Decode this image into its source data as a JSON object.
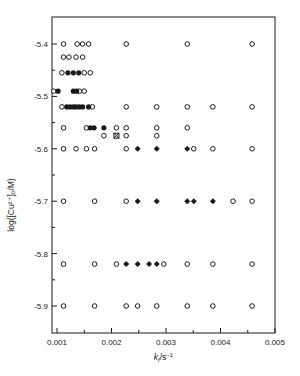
{
  "chart_data": {
    "type": "scatter",
    "title": "",
    "xlabel": "k_f/s^-1",
    "xlabel_parts": {
      "main": "k",
      "sub": "f",
      "rest": "/s",
      "sup": "−1"
    },
    "ylabel": "log([Cu2+]0/M)",
    "ylabel_text": "log([Cu²⁺]₀/M)",
    "xlim": [
      0.00092,
      0.005
    ],
    "ylim": [
      -5.95,
      -5.35
    ],
    "xticks": [
      0.001,
      0.002,
      0.003,
      0.004,
      0.005
    ],
    "xtick_labels": [
      "0.001",
      "0.002",
      "0.003",
      "0.004",
      "0.005"
    ],
    "xminor": [
      0.0015,
      0.0025,
      0.0035,
      0.0045
    ],
    "yticks": [
      -5.4,
      -5.5,
      -5.6,
      -5.7,
      -5.8,
      -5.9
    ],
    "ytick_labels": [
      "-5.4",
      "-5.5",
      "-5.6",
      "-5.7",
      "-5.8",
      "-5.9"
    ],
    "yminor": [
      -5.45,
      -5.55,
      -5.65,
      -5.75,
      -5.85
    ],
    "grid": false,
    "legend": null,
    "series": [
      {
        "name": "open circles",
        "marker": "open-circle",
        "points": [
          [
            0.00112,
            -5.4
          ],
          [
            0.00137,
            -5.4
          ],
          [
            0.00147,
            -5.4
          ],
          [
            0.00158,
            -5.4
          ],
          [
            0.00227,
            -5.4
          ],
          [
            0.00339,
            -5.4
          ],
          [
            0.00458,
            -5.4
          ],
          [
            0.00112,
            -5.425
          ],
          [
            0.00122,
            -5.425
          ],
          [
            0.00135,
            -5.425
          ],
          [
            0.00147,
            -5.425
          ],
          [
            0.00109,
            -5.455
          ],
          [
            0.0015,
            -5.455
          ],
          [
            0.00161,
            -5.455
          ],
          [
            0.00094,
            -5.49
          ],
          [
            0.00141,
            -5.49
          ],
          [
            0.0015,
            -5.49
          ],
          [
            0.00109,
            -5.52
          ],
          [
            0.00165,
            -5.52
          ],
          [
            0.00227,
            -5.52
          ],
          [
            0.00283,
            -5.52
          ],
          [
            0.00339,
            -5.52
          ],
          [
            0.00386,
            -5.52
          ],
          [
            0.00458,
            -5.52
          ],
          [
            0.00112,
            -5.56
          ],
          [
            0.00154,
            -5.56
          ],
          [
            0.00209,
            -5.56
          ],
          [
            0.00227,
            -5.56
          ],
          [
            0.00283,
            -5.56
          ],
          [
            0.00339,
            -5.56
          ],
          [
            0.00186,
            -5.575
          ],
          [
            0.00227,
            -5.575
          ],
          [
            0.00283,
            -5.575
          ],
          [
            0.00112,
            -5.6
          ],
          [
            0.00135,
            -5.6
          ],
          [
            0.00154,
            -5.6
          ],
          [
            0.00169,
            -5.6
          ],
          [
            0.00227,
            -5.6
          ],
          [
            0.00351,
            -5.6
          ],
          [
            0.00386,
            -5.6
          ],
          [
            0.00458,
            -5.6
          ],
          [
            0.00112,
            -5.7
          ],
          [
            0.00169,
            -5.7
          ],
          [
            0.00227,
            -5.7
          ],
          [
            0.00423,
            -5.7
          ],
          [
            0.00458,
            -5.7
          ],
          [
            0.00112,
            -5.82
          ],
          [
            0.00169,
            -5.82
          ],
          [
            0.00209,
            -5.82
          ],
          [
            0.00296,
            -5.82
          ],
          [
            0.00339,
            -5.82
          ],
          [
            0.00386,
            -5.82
          ],
          [
            0.00458,
            -5.82
          ],
          [
            0.00112,
            -5.9
          ],
          [
            0.00169,
            -5.9
          ],
          [
            0.00227,
            -5.9
          ],
          [
            0.00248,
            -5.9
          ],
          [
            0.00283,
            -5.9
          ],
          [
            0.00339,
            -5.9
          ],
          [
            0.00386,
            -5.9
          ],
          [
            0.00458,
            -5.9
          ]
        ]
      },
      {
        "name": "filled circles",
        "marker": "filled-circle",
        "points": [
          [
            0.0012,
            -5.455
          ],
          [
            0.0013,
            -5.455
          ],
          [
            0.0014,
            -5.455
          ],
          [
            0.00102,
            -5.49
          ],
          [
            0.0013,
            -5.49
          ],
          [
            0.00136,
            -5.49
          ],
          [
            0.00118,
            -5.52
          ],
          [
            0.00124,
            -5.52
          ],
          [
            0.0013,
            -5.52
          ],
          [
            0.00135,
            -5.52
          ],
          [
            0.00141,
            -5.52
          ],
          [
            0.00147,
            -5.52
          ],
          [
            0.00158,
            -5.52
          ],
          [
            0.00161,
            -5.56
          ],
          [
            0.00168,
            -5.56
          ],
          [
            0.00186,
            -5.56
          ]
        ]
      },
      {
        "name": "filled diamonds",
        "marker": "filled-diamond",
        "points": [
          [
            0.00248,
            -5.6
          ],
          [
            0.00283,
            -5.6
          ],
          [
            0.00339,
            -5.6
          ],
          [
            0.00248,
            -5.7
          ],
          [
            0.00283,
            -5.7
          ],
          [
            0.00339,
            -5.7
          ],
          [
            0.00351,
            -5.7
          ],
          [
            0.00386,
            -5.7
          ],
          [
            0.00227,
            -5.82
          ],
          [
            0.00248,
            -5.82
          ],
          [
            0.00269,
            -5.82
          ],
          [
            0.00283,
            -5.82
          ]
        ]
      },
      {
        "name": "crossed square",
        "marker": "crossed-square",
        "points": [
          [
            0.00209,
            -5.575
          ]
        ]
      }
    ]
  },
  "layout": {
    "plot_left": 52,
    "plot_right": 275,
    "plot_top": 17,
    "plot_bottom": 333,
    "x0_px": 57,
    "px_per_unit_x": 54500,
    "y0_px": 44,
    "y0_val": -5.4,
    "px_per_unit_y": 524,
    "ink_color": "#1a1a1a"
  }
}
